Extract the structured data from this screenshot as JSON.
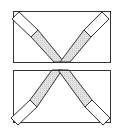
{
  "diagram": {
    "title": "",
    "panels": [
      {
        "name": "top-panel",
        "orientation": "V",
        "frame": {
          "x": 13,
          "y": 11,
          "w": 97,
          "h": 51
        },
        "bars": [
          {
            "name": "left-bar",
            "outer": [
              [
                12,
                19
              ],
              [
                19,
                12
              ]
            ],
            "divider": [
              [
                31,
                36
              ],
              [
                38,
                29
              ]
            ],
            "inner": [
              [
                52,
                62
              ],
              [
                62,
                62
              ]
            ]
          },
          {
            "name": "right-bar",
            "outer": [
              [
                101,
                12
              ],
              [
                109,
                19
              ]
            ],
            "divider": [
              [
                84,
                29
              ],
              [
                91,
                36
              ]
            ],
            "inner": [
              [
                61,
                62
              ],
              [
                70,
                62
              ]
            ]
          }
        ]
      },
      {
        "name": "bottom-panel",
        "orientation": "inverted-V",
        "frame": {
          "x": 13,
          "y": 70,
          "w": 97,
          "h": 52
        },
        "bars": [
          {
            "name": "left-bar",
            "outer": [
              [
                11,
                117
              ],
              [
                18,
                124
              ]
            ],
            "divider": [
              [
                30,
                101
              ],
              [
                37,
                108
              ]
            ],
            "inner": [
              [
                52,
                70
              ],
              [
                61,
                70
              ]
            ]
          },
          {
            "name": "right-bar",
            "outer": [
              [
                103,
                124
              ],
              [
                110,
                117
              ]
            ],
            "divider": [
              [
                84,
                108
              ],
              [
                91,
                101
              ]
            ],
            "inner": [
              [
                59,
                70
              ],
              [
                70,
                70
              ]
            ]
          }
        ]
      }
    ],
    "colors": {
      "stroke": "#333333",
      "shade": "#d9d9d9",
      "background": "#ffffff"
    }
  }
}
